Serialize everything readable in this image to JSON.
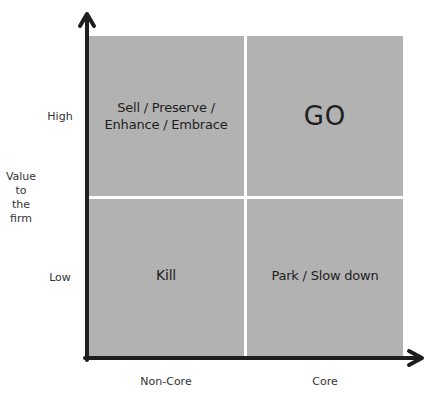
{
  "diagram": {
    "type": "2x2 matrix",
    "y_axis": {
      "title_lines": [
        "Value",
        "to",
        "the",
        "firm"
      ],
      "high_label": "High",
      "low_label": "Low"
    },
    "x_axis": {
      "left_label": "Non-Core",
      "right_label": "Core"
    },
    "quadrants": {
      "top_left": {
        "line1": "Sell / Preserve /",
        "line2": "Enhance / Embrace"
      },
      "top_right": {
        "label": "GO"
      },
      "bottom_left": {
        "label": "Kill"
      },
      "bottom_right": {
        "label": "Park / Slow down"
      }
    },
    "colors": {
      "quadrant_fill": "#b2b2b2",
      "divider": "#ffffff",
      "axis": "#1e1e1e"
    }
  }
}
